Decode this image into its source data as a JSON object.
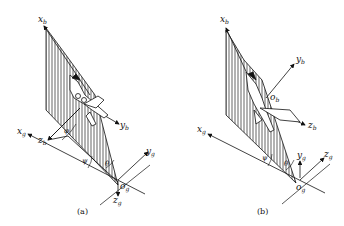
{
  "figure": {
    "panel_a": {
      "caption": "(a)",
      "axes": {
        "xb": {
          "base": "x",
          "sub": "b"
        },
        "yb": {
          "base": "y",
          "sub": "b"
        },
        "zb": {
          "base": "z",
          "sub": "b"
        },
        "xg": {
          "base": "x",
          "sub": "g"
        },
        "yg": {
          "base": "y",
          "sub": "g"
        },
        "zg": {
          "base": "z",
          "sub": "g"
        },
        "og": {
          "base": "o",
          "sub": "g"
        }
      },
      "angles": [
        "φ",
        "ψ",
        "θ"
      ]
    },
    "panel_b": {
      "caption": "(b)",
      "axes": {
        "xb": {
          "base": "x",
          "sub": "b"
        },
        "yb": {
          "base": "y",
          "sub": "b"
        },
        "zb": {
          "base": "z",
          "sub": "b"
        },
        "ob": {
          "base": "o",
          "sub": "b"
        },
        "xg": {
          "base": "x",
          "sub": "g"
        },
        "yg": {
          "base": "y",
          "sub": "g"
        },
        "zg": {
          "base": "z",
          "sub": "g"
        },
        "og": {
          "base": "o",
          "sub": "g"
        }
      },
      "angles": [
        "ψ",
        "θ"
      ]
    }
  }
}
